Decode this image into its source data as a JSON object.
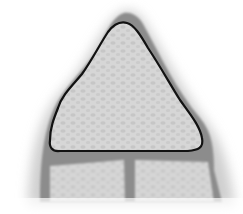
{
  "figure": {
    "colors": {
      "background": "#ffffff",
      "halo": "#c8c8c8",
      "wall": "#8c8c8c",
      "cell_fill": "#d6d6d6",
      "cell_texture": "#c4c4c4",
      "outline": "#111111"
    }
  }
}
